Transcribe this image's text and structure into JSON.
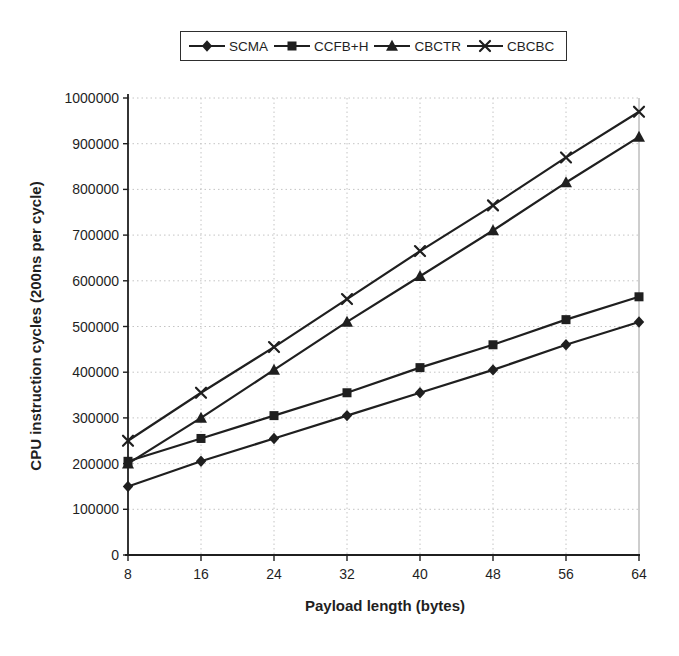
{
  "chart_data": {
    "type": "line",
    "x": [
      8,
      16,
      24,
      32,
      40,
      48,
      56,
      64
    ],
    "xlim": [
      8,
      64
    ],
    "ylim": [
      0,
      1000000
    ],
    "ytick_step": 100000,
    "xlabel": "Payload length (bytes)",
    "ylabel": "CPU instruction cycles (200ns per cycle)",
    "grid": true,
    "legend_position": "top-center",
    "ink_color": "#1f1f1f",
    "grid_color": "#c4c4c4",
    "series": [
      {
        "name": "SCMA",
        "marker": "diamond",
        "values": [
          150000,
          205000,
          255000,
          305000,
          355000,
          405000,
          460000,
          510000
        ]
      },
      {
        "name": "CCFB+H",
        "marker": "square",
        "values": [
          205000,
          255000,
          305000,
          355000,
          410000,
          460000,
          515000,
          565000
        ]
      },
      {
        "name": "CBCTR",
        "marker": "triangle",
        "values": [
          200000,
          300000,
          405000,
          510000,
          610000,
          710000,
          815000,
          915000
        ]
      },
      {
        "name": "CBCBC",
        "marker": "x",
        "values": [
          250000,
          355000,
          455000,
          560000,
          665000,
          765000,
          870000,
          970000
        ]
      }
    ]
  }
}
